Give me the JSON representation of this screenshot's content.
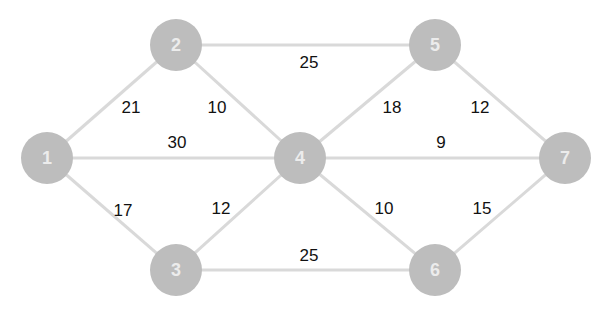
{
  "graph": {
    "type": "weighted-undirected",
    "node_color": "#bdbdbd",
    "edge_color": "#d9d9d9",
    "nodes": [
      {
        "id": "1",
        "label": "1",
        "x": 47,
        "y": 158
      },
      {
        "id": "2",
        "label": "2",
        "x": 176,
        "y": 45
      },
      {
        "id": "3",
        "label": "3",
        "x": 176,
        "y": 270
      },
      {
        "id": "4",
        "label": "4",
        "x": 300,
        "y": 158
      },
      {
        "id": "5",
        "label": "5",
        "x": 435,
        "y": 45
      },
      {
        "id": "6",
        "label": "6",
        "x": 435,
        "y": 270
      },
      {
        "id": "7",
        "label": "7",
        "x": 565,
        "y": 158
      }
    ],
    "edges": [
      {
        "from": "1",
        "to": "2",
        "weight": "21",
        "lx": 131,
        "ly": 107
      },
      {
        "from": "1",
        "to": "4",
        "weight": "30",
        "lx": 177,
        "ly": 142
      },
      {
        "from": "1",
        "to": "3",
        "weight": "17",
        "lx": 123,
        "ly": 210
      },
      {
        "from": "2",
        "to": "4",
        "weight": "10",
        "lx": 217,
        "ly": 107
      },
      {
        "from": "2",
        "to": "5",
        "weight": "25",
        "lx": 309,
        "ly": 62
      },
      {
        "from": "3",
        "to": "4",
        "weight": "12",
        "lx": 221,
        "ly": 208
      },
      {
        "from": "3",
        "to": "6",
        "weight": "25",
        "lx": 309,
        "ly": 255
      },
      {
        "from": "4",
        "to": "5",
        "weight": "18",
        "lx": 392,
        "ly": 107
      },
      {
        "from": "4",
        "to": "7",
        "weight": "9",
        "lx": 441,
        "ly": 142
      },
      {
        "from": "4",
        "to": "6",
        "weight": "10",
        "lx": 384,
        "ly": 208
      },
      {
        "from": "5",
        "to": "7",
        "weight": "12",
        "lx": 480,
        "ly": 107
      },
      {
        "from": "6",
        "to": "7",
        "weight": "15",
        "lx": 482,
        "ly": 208
      }
    ]
  }
}
